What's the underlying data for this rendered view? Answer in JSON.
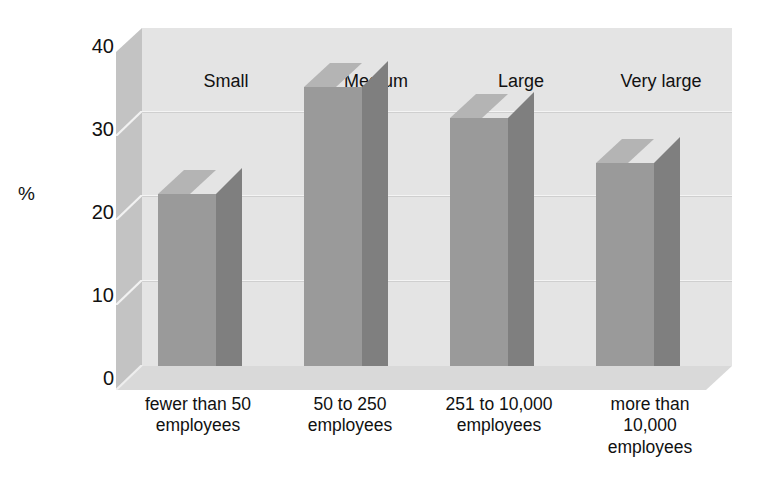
{
  "chart_data": {
    "type": "bar",
    "title": "",
    "subtitle": "",
    "xlabel": "",
    "ylabel": "%",
    "ylim": [
      0,
      40
    ],
    "yticks": [
      0,
      10,
      20,
      30,
      40
    ],
    "grid": true,
    "grid_axis": "y",
    "legend": false,
    "style": "3d-bar",
    "categories": [
      "fewer than 50 employees",
      "50 to 250 employees",
      "251 to 10,000 employees",
      "more than 10,000 employees"
    ],
    "category_group_labels": [
      "Small",
      "Medium",
      "Large",
      "Very large"
    ],
    "values": [
      20.3,
      33.0,
      29.3,
      24.0
    ],
    "units": "percent",
    "series": [
      {
        "name": "Share of respondents",
        "values": [
          20.3,
          33.0,
          29.3,
          24.0
        ]
      }
    ]
  },
  "axes": {
    "y_axis_title": "%",
    "y_tick_labels": [
      "40",
      "30",
      "20",
      "10",
      "0"
    ]
  },
  "top_labels": [
    {
      "label": "Small"
    },
    {
      "label": "Medium"
    },
    {
      "label": "Large"
    },
    {
      "label": "Very large"
    }
  ],
  "bottom_labels": [
    {
      "line1": "fewer than 50",
      "line2": "employees",
      "line3": ""
    },
    {
      "line1": "50 to 250",
      "line2": "employees",
      "line3": ""
    },
    {
      "line1": "251 to 10,000",
      "line2": "employees",
      "line3": ""
    },
    {
      "line1": "more than",
      "line2": "10,000",
      "line3": "employees"
    }
  ],
  "colors": {
    "bar_front": "#9a9a9a",
    "bar_top": "#b4b4b4",
    "bar_side": "#7f7f7f",
    "back_wall": "#e4e4e4",
    "left_wall": "#c3c3c3",
    "floor": "#d9d9d9",
    "gridline": "#cfcfcf",
    "text": "#111111",
    "background": "#ffffff"
  }
}
